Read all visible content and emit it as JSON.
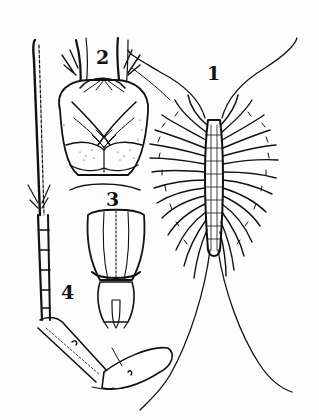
{
  "figure": {
    "ink_color": "#111111",
    "paper_color": "#fdfdfd",
    "labels": [
      {
        "id": "1",
        "text": "1",
        "x": 207,
        "y": 64
      },
      {
        "id": "2",
        "text": "2",
        "x": 96,
        "y": 48
      },
      {
        "id": "3",
        "text": "3",
        "x": 106,
        "y": 190
      },
      {
        "id": "4",
        "text": "4",
        "x": 61,
        "y": 283
      }
    ],
    "parts": [
      {
        "label": "1",
        "name": "whole-animal-dorsal-view"
      },
      {
        "label": "2",
        "name": "head-ventral-view"
      },
      {
        "label": "3",
        "name": "posterior-segment"
      },
      {
        "label": "4",
        "name": "leg"
      }
    ]
  }
}
